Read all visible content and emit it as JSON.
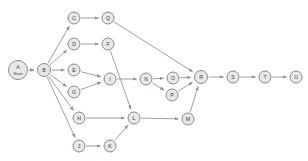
{
  "diagram": {
    "type": "directed-graph",
    "canvas": {
      "width": 308,
      "height": 161,
      "background": "#ffffff"
    },
    "style": {
      "node_fill": "#e8e8e8",
      "node_stroke": "#8a8a8a",
      "edge_color": "#8f8f8f",
      "label_color": "#3a3a3a",
      "node_radius": 6.5,
      "start_node_radius": 9.5
    },
    "nodes": [
      {
        "id": "A",
        "label": "A",
        "sublabel": "Start",
        "x": 18,
        "y": 70,
        "r": 9.5,
        "is_start": true
      },
      {
        "id": "B",
        "label": "B",
        "sublabel": "",
        "x": 44,
        "y": 70,
        "r": 6.5,
        "is_start": false
      },
      {
        "id": "C",
        "label": "C",
        "sublabel": "",
        "x": 74,
        "y": 18,
        "r": 6.0,
        "is_start": false
      },
      {
        "id": "Q",
        "label": "Q",
        "sublabel": "",
        "x": 108,
        "y": 18,
        "r": 6.0,
        "is_start": false
      },
      {
        "id": "D",
        "label": "D",
        "sublabel": "",
        "x": 74,
        "y": 44,
        "r": 6.0,
        "is_start": false
      },
      {
        "id": "F",
        "label": "F",
        "sublabel": "",
        "x": 108,
        "y": 44,
        "r": 6.0,
        "is_start": false
      },
      {
        "id": "E",
        "label": "E",
        "sublabel": "",
        "x": 74,
        "y": 70,
        "r": 6.0,
        "is_start": false
      },
      {
        "id": "G",
        "label": "G",
        "sublabel": "",
        "x": 74,
        "y": 92,
        "r": 6.0,
        "is_start": false
      },
      {
        "id": "I",
        "label": "I",
        "sublabel": "",
        "x": 110,
        "y": 79,
        "r": 6.0,
        "is_start": false
      },
      {
        "id": "N",
        "label": "N",
        "sublabel": "",
        "x": 146,
        "y": 79,
        "r": 6.0,
        "is_start": false
      },
      {
        "id": "O",
        "label": "O",
        "sublabel": "",
        "x": 173,
        "y": 78,
        "r": 6.0,
        "is_start": false
      },
      {
        "id": "P",
        "label": "P",
        "sublabel": "",
        "x": 172,
        "y": 95,
        "r": 6.0,
        "is_start": false
      },
      {
        "id": "R",
        "label": "R",
        "sublabel": "",
        "x": 201,
        "y": 77,
        "r": 6.5,
        "is_start": false
      },
      {
        "id": "S",
        "label": "S",
        "sublabel": "",
        "x": 233,
        "y": 77,
        "r": 6.0,
        "is_start": false
      },
      {
        "id": "T",
        "label": "T",
        "sublabel": "",
        "x": 265,
        "y": 77,
        "r": 6.0,
        "is_start": false
      },
      {
        "id": "U",
        "label": "U",
        "sublabel": "",
        "x": 296,
        "y": 77,
        "r": 6.0,
        "is_start": false
      },
      {
        "id": "H",
        "label": "H",
        "sublabel": "",
        "x": 79,
        "y": 118,
        "r": 6.0,
        "is_start": false
      },
      {
        "id": "L",
        "label": "L",
        "sublabel": "",
        "x": 134,
        "y": 118,
        "r": 6.0,
        "is_start": false
      },
      {
        "id": "M",
        "label": "M",
        "sublabel": "",
        "x": 188,
        "y": 119,
        "r": 6.0,
        "is_start": false
      },
      {
        "id": "J",
        "label": "J",
        "sublabel": "",
        "x": 79,
        "y": 146,
        "r": 6.0,
        "is_start": false
      },
      {
        "id": "K",
        "label": "K",
        "sublabel": "",
        "x": 110,
        "y": 146,
        "r": 6.0,
        "is_start": false
      }
    ],
    "edges": [
      {
        "from": "A",
        "to": "B"
      },
      {
        "from": "B",
        "to": "C"
      },
      {
        "from": "B",
        "to": "D"
      },
      {
        "from": "B",
        "to": "E"
      },
      {
        "from": "B",
        "to": "G"
      },
      {
        "from": "B",
        "to": "H"
      },
      {
        "from": "B",
        "to": "J"
      },
      {
        "from": "C",
        "to": "Q"
      },
      {
        "from": "D",
        "to": "F"
      },
      {
        "from": "E",
        "to": "I"
      },
      {
        "from": "G",
        "to": "I"
      },
      {
        "from": "I",
        "to": "N"
      },
      {
        "from": "F",
        "to": "L"
      },
      {
        "from": "Q",
        "to": "R"
      },
      {
        "from": "N",
        "to": "O"
      },
      {
        "from": "N",
        "to": "P"
      },
      {
        "from": "O",
        "to": "R"
      },
      {
        "from": "P",
        "to": "R"
      },
      {
        "from": "H",
        "to": "L"
      },
      {
        "from": "J",
        "to": "K"
      },
      {
        "from": "K",
        "to": "L"
      },
      {
        "from": "L",
        "to": "M"
      },
      {
        "from": "M",
        "to": "R"
      },
      {
        "from": "R",
        "to": "S"
      },
      {
        "from": "S",
        "to": "T"
      },
      {
        "from": "T",
        "to": "U"
      }
    ]
  }
}
